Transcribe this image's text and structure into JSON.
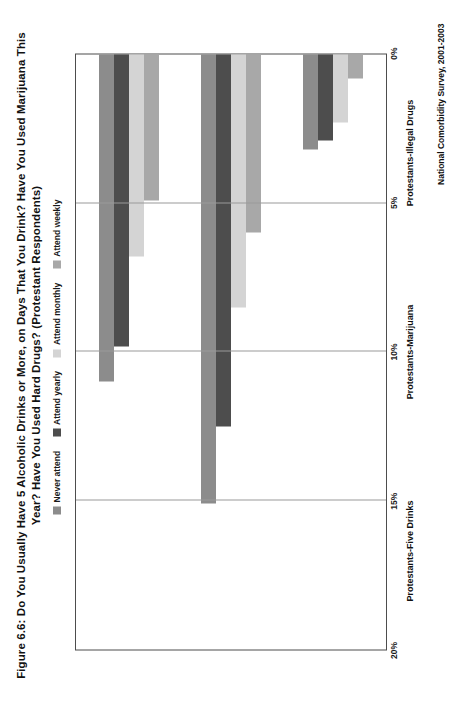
{
  "figure": {
    "title": "Figure 6.6: Do You Usually Have 5 Alcoholic Drinks or More, on Days That You Drink? Have You Used Marijuana This Year? Have You Used Hard Drugs? (Protestant Respondents)",
    "source_note": "National Comorbidity Survey, 2001-2003"
  },
  "legend": {
    "items": [
      {
        "label": "Never attend",
        "color": "#8c8c8c"
      },
      {
        "label": "Attend yearly",
        "color": "#4d4d4d"
      },
      {
        "label": "Attend monthly",
        "color": "#d4d4d4"
      },
      {
        "label": "Attend weekly",
        "color": "#a8a8a8"
      }
    ]
  },
  "axis": {
    "ticks": [
      "0%",
      "5%",
      "10%",
      "15%",
      "20%"
    ],
    "tick_values": [
      0,
      5,
      10,
      15,
      20
    ],
    "max": 20,
    "unit": "%"
  },
  "chart_data": {
    "type": "bar",
    "orientation": "horizontal",
    "title": "Figure 6.6: Do You Usually Have 5 Alcoholic Drinks or More, on Days That You Drink? Have You Used Marijuana This Year? Have You Used Hard Drugs? (Protestant Respondents)",
    "xlabel": "",
    "ylabel": "",
    "ylim": [
      0,
      20
    ],
    "grid": true,
    "legend_position": "top",
    "categories": [
      "Protestants-Five Drinks",
      "Protestants-Marijuana",
      "Protestants-Illegal Drugs"
    ],
    "series": [
      {
        "name": "Never attend",
        "color": "#8c8c8c",
        "values": [
          11.0,
          15.1,
          3.2
        ]
      },
      {
        "name": "Attend yearly",
        "color": "#4d4d4d",
        "values": [
          9.8,
          12.5,
          2.9
        ]
      },
      {
        "name": "Attend monthly",
        "color": "#d4d4d4",
        "values": [
          6.8,
          8.5,
          2.3
        ]
      },
      {
        "name": "Attend weekly",
        "color": "#a8a8a8",
        "values": [
          4.9,
          6.0,
          0.8
        ]
      }
    ]
  }
}
